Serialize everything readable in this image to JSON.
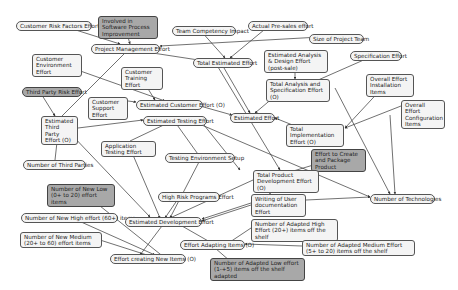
{
  "diagram": {
    "type": "dependency-graph",
    "nodes": [
      {
        "id": "n1",
        "label": "Customer Risk Factors Effort",
        "x": 16,
        "y": 21,
        "w": 76,
        "style": "pill"
      },
      {
        "id": "n2",
        "label": "Involved in Software Process Improvement",
        "x": 98,
        "y": 16,
        "w": 60,
        "style": "box dark"
      },
      {
        "id": "n3",
        "label": "Team Competency Impact",
        "x": 172,
        "y": 26,
        "w": 64,
        "style": "pill"
      },
      {
        "id": "n4",
        "label": "Actual Pre-sales effort",
        "x": 248,
        "y": 21,
        "w": 60,
        "style": "pill"
      },
      {
        "id": "n5",
        "label": "Project Management Effort",
        "x": 91,
        "y": 44,
        "w": 69,
        "style": "pill"
      },
      {
        "id": "n6",
        "label": "Size of Project Team",
        "x": 309,
        "y": 34,
        "w": 55,
        "style": "pill"
      },
      {
        "id": "n7",
        "label": "Total Estimated Effort",
        "x": 193,
        "y": 58,
        "w": 60,
        "style": "pill"
      },
      {
        "id": "n8",
        "label": "Estimated Analysis & Design Effort (post-sale)",
        "x": 264,
        "y": 50,
        "w": 64,
        "style": "box"
      },
      {
        "id": "n9",
        "label": "Specification Effort",
        "x": 350,
        "y": 51,
        "w": 52,
        "style": "pill"
      },
      {
        "id": "n10",
        "label": "Customer Environment Effort",
        "x": 32,
        "y": 54,
        "w": 50,
        "style": "box"
      },
      {
        "id": "n11",
        "label": "Customer Training Effort",
        "x": 121,
        "y": 67,
        "w": 42,
        "style": "box"
      },
      {
        "id": "n12",
        "label": "Total Analysis and Specification Effort (O)",
        "x": 266,
        "y": 79,
        "w": 64,
        "style": "box"
      },
      {
        "id": "n13",
        "label": "Overall Effort Installation Items",
        "x": 366,
        "y": 74,
        "w": 48,
        "style": "box"
      },
      {
        "id": "n14",
        "label": "Third Party Risk Effort",
        "x": 22,
        "y": 87,
        "w": 60,
        "style": "pill dark"
      },
      {
        "id": "n15",
        "label": "Customer Support Effort",
        "x": 88,
        "y": 97,
        "w": 40,
        "style": "box"
      },
      {
        "id": "n16",
        "label": "Estimated Customer Effort (O)",
        "x": 136,
        "y": 100,
        "w": 67,
        "style": "pill"
      },
      {
        "id": "n17",
        "label": "Estimated Effort",
        "x": 230,
        "y": 113,
        "w": 45,
        "style": "pill"
      },
      {
        "id": "n18",
        "label": "Overall Effort Configuration Items",
        "x": 401,
        "y": 100,
        "w": 44,
        "style": "box"
      },
      {
        "id": "n19",
        "label": "Estimated Third Party Effort (O)",
        "x": 41,
        "y": 116,
        "w": 37,
        "style": "box"
      },
      {
        "id": "n20",
        "label": "Estimated Testing Effort",
        "x": 143,
        "y": 116,
        "w": 64,
        "style": "pill"
      },
      {
        "id": "n21",
        "label": "Total Implementation Effort (O)",
        "x": 286,
        "y": 124,
        "w": 58,
        "style": "box"
      },
      {
        "id": "n22",
        "label": "Application Testing Effort",
        "x": 101,
        "y": 141,
        "w": 55,
        "style": "box"
      },
      {
        "id": "n23",
        "label": "Effort to Create and Package Product",
        "x": 311,
        "y": 149,
        "w": 55,
        "style": "box dark"
      },
      {
        "id": "n24",
        "label": "Testing Environment Setup",
        "x": 165,
        "y": 153,
        "w": 70,
        "style": "pill"
      },
      {
        "id": "n25",
        "label": "Number of Third Parties",
        "x": 23,
        "y": 160,
        "w": 63,
        "style": "pill"
      },
      {
        "id": "n26",
        "label": "Total Product Development Effort (O)",
        "x": 253,
        "y": 170,
        "w": 66,
        "style": "box"
      },
      {
        "id": "n27",
        "label": "High Risk Programs Effort",
        "x": 158,
        "y": 192,
        "w": 62,
        "style": "pill"
      },
      {
        "id": "n28",
        "label": "Writing of User documentation Effort",
        "x": 251,
        "y": 194,
        "w": 55,
        "style": "box"
      },
      {
        "id": "n29",
        "label": "Number of Technologies",
        "x": 370,
        "y": 194,
        "w": 65,
        "style": "pill"
      },
      {
        "id": "n30",
        "label": "Number of New Low (0+ to 20) effort items",
        "x": 47,
        "y": 184,
        "w": 68,
        "style": "box dark"
      },
      {
        "id": "n31",
        "label": "Number of New High effort (60+) items",
        "x": 21,
        "y": 213,
        "w": 97,
        "style": "pill"
      },
      {
        "id": "n32",
        "label": "Estimated Development Effort",
        "x": 125,
        "y": 217,
        "w": 77,
        "style": "pill"
      },
      {
        "id": "n33",
        "label": "Number of Adapted High Effort (20+) items off the shelf",
        "x": 251,
        "y": 219,
        "w": 87,
        "style": "box"
      },
      {
        "id": "n34",
        "label": "Number of New Medium (20+ to 60) effort items",
        "x": 20,
        "y": 232,
        "w": 82,
        "style": "box"
      },
      {
        "id": "n35",
        "label": "Effort Adapting Items (O)",
        "x": 180,
        "y": 240,
        "w": 65,
        "style": "pill"
      },
      {
        "id": "n36",
        "label": "Number of Adapted Medium Effort (5+ to 20) items off the shelf",
        "x": 302,
        "y": 240,
        "w": 113,
        "style": "box"
      },
      {
        "id": "n37",
        "label": "Effort creating New Items (O)",
        "x": 110,
        "y": 254,
        "w": 76,
        "style": "pill"
      },
      {
        "id": "n38",
        "label": "Number of Adapted Low effort (1-+5) items off the shelf adapted",
        "x": 210,
        "y": 258,
        "w": 95,
        "style": "box dark"
      }
    ],
    "edges": [
      [
        125,
        27,
        130,
        44
      ],
      [
        60,
        25,
        120,
        44
      ],
      [
        200,
        30,
        225,
        58
      ],
      [
        270,
        25,
        230,
        58
      ],
      [
        120,
        48,
        205,
        61
      ],
      [
        320,
        37,
        160,
        46
      ],
      [
        295,
        55,
        295,
        79
      ],
      [
        375,
        55,
        300,
        88
      ],
      [
        55,
        62,
        165,
        101
      ],
      [
        140,
        76,
        155,
        100
      ],
      [
        128,
        101,
        136,
        102
      ],
      [
        220,
        61,
        250,
        113
      ],
      [
        280,
        92,
        255,
        113
      ],
      [
        193,
        104,
        232,
        115
      ],
      [
        300,
        128,
        275,
        118
      ],
      [
        385,
        85,
        345,
        128
      ],
      [
        401,
        106,
        345,
        128
      ],
      [
        130,
        48,
        60,
        118
      ],
      [
        40,
        92,
        55,
        116
      ],
      [
        78,
        128,
        143,
        120
      ],
      [
        55,
        160,
        58,
        133
      ],
      [
        130,
        141,
        170,
        122
      ],
      [
        200,
        157,
        175,
        122
      ],
      [
        190,
        120,
        370,
        197
      ],
      [
        70,
        133,
        150,
        217
      ],
      [
        330,
        160,
        290,
        172
      ],
      [
        215,
        62,
        280,
        170
      ],
      [
        335,
        88,
        390,
        194
      ],
      [
        390,
        115,
        395,
        194
      ],
      [
        200,
        120,
        240,
        170
      ],
      [
        253,
        180,
        170,
        218
      ],
      [
        180,
        196,
        165,
        218
      ],
      [
        200,
        160,
        170,
        218
      ],
      [
        130,
        148,
        160,
        218
      ],
      [
        270,
        184,
        270,
        194
      ],
      [
        251,
        203,
        202,
        219
      ],
      [
        251,
        205,
        202,
        221
      ],
      [
        306,
        200,
        370,
        197
      ],
      [
        80,
        190,
        165,
        258
      ],
      [
        70,
        217,
        155,
        255
      ],
      [
        100,
        240,
        150,
        256
      ],
      [
        165,
        222,
        140,
        255
      ],
      [
        175,
        222,
        210,
        242
      ],
      [
        251,
        228,
        230,
        242
      ],
      [
        302,
        246,
        245,
        244
      ],
      [
        230,
        261,
        215,
        248
      ]
    ]
  }
}
